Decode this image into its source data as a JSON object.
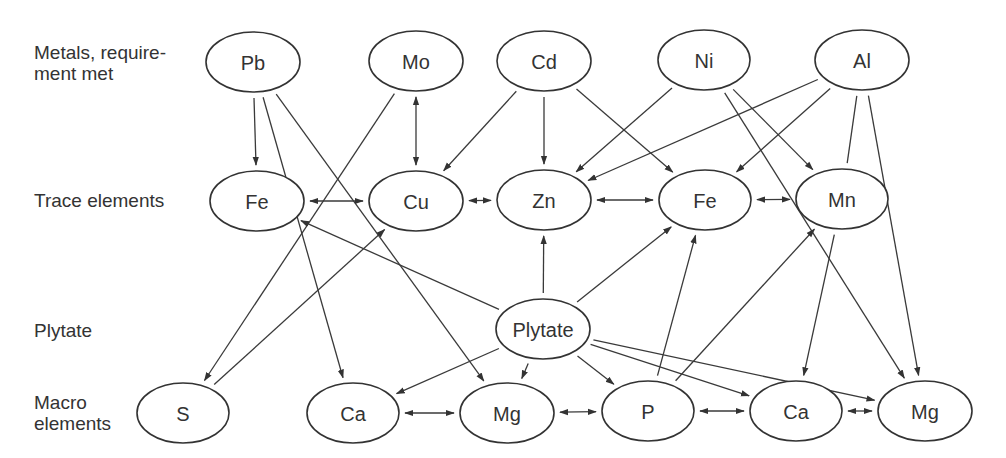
{
  "row_labels": [
    {
      "id": "metals",
      "text": "Metals, require-\nment met",
      "top": 42
    },
    {
      "id": "trace",
      "text": "Trace elements",
      "top": 190
    },
    {
      "id": "plytate",
      "text": "Plytate",
      "top": 320
    },
    {
      "id": "macro",
      "text": "Macro\nelements",
      "top": 392
    }
  ],
  "nodes": [
    {
      "id": "Pb",
      "label": "Pb",
      "cx": 253,
      "cy": 62,
      "rx": 47,
      "ry": 30
    },
    {
      "id": "Mo",
      "label": "Mo",
      "cx": 416,
      "cy": 61,
      "rx": 47,
      "ry": 30
    },
    {
      "id": "Cd",
      "label": "Cd",
      "cx": 544,
      "cy": 61,
      "rx": 47,
      "ry": 30
    },
    {
      "id": "Ni",
      "label": "Ni",
      "cx": 704,
      "cy": 60,
      "rx": 46,
      "ry": 30
    },
    {
      "id": "Al",
      "label": "Al",
      "cx": 862,
      "cy": 60,
      "rx": 47,
      "ry": 30
    },
    {
      "id": "Fe1",
      "label": "Fe",
      "cx": 257,
      "cy": 201,
      "rx": 47,
      "ry": 30
    },
    {
      "id": "Cu",
      "label": "Cu",
      "cx": 416,
      "cy": 201,
      "rx": 47,
      "ry": 30
    },
    {
      "id": "Zn",
      "label": "Zn",
      "cx": 544,
      "cy": 200,
      "rx": 47,
      "ry": 30
    },
    {
      "id": "Fe2",
      "label": "Fe",
      "cx": 705,
      "cy": 200,
      "rx": 46,
      "ry": 30
    },
    {
      "id": "Mn",
      "label": "Mn",
      "cx": 842,
      "cy": 199,
      "rx": 46,
      "ry": 30
    },
    {
      "id": "Plytate",
      "label": "Plytate",
      "cx": 543,
      "cy": 329,
      "rx": 47,
      "ry": 30
    },
    {
      "id": "S",
      "label": "S",
      "cx": 183,
      "cy": 413,
      "rx": 46,
      "ry": 30
    },
    {
      "id": "Ca1",
      "label": "Ca",
      "cx": 353,
      "cy": 413,
      "rx": 46,
      "ry": 30
    },
    {
      "id": "Mg1",
      "label": "Mg",
      "cx": 507,
      "cy": 413,
      "rx": 47,
      "ry": 30
    },
    {
      "id": "P",
      "label": "P",
      "cx": 648,
      "cy": 411,
      "rx": 46,
      "ry": 30
    },
    {
      "id": "Ca2",
      "label": "Ca",
      "cx": 796,
      "cy": 411,
      "rx": 46,
      "ry": 30
    },
    {
      "id": "Mg2",
      "label": "Mg",
      "cx": 925,
      "cy": 411,
      "rx": 47,
      "ry": 30
    }
  ],
  "edges": [
    {
      "from": "Pb",
      "to": "Fe1",
      "type": "directed"
    },
    {
      "from": "Pb",
      "to": "Ca1",
      "type": "directed"
    },
    {
      "from": "Pb",
      "to": "Mg1",
      "type": "directed"
    },
    {
      "from": "Mo",
      "to": "Cu",
      "type": "bidirectional"
    },
    {
      "from": "Mo",
      "to": "S",
      "type": "directed"
    },
    {
      "from": "S",
      "to": "Cu",
      "type": "directed"
    },
    {
      "from": "Cd",
      "to": "Cu",
      "type": "directed"
    },
    {
      "from": "Cd",
      "to": "Zn",
      "type": "directed"
    },
    {
      "from": "Cd",
      "to": "Fe2",
      "type": "directed"
    },
    {
      "from": "Ni",
      "to": "Zn",
      "type": "directed"
    },
    {
      "from": "Ni",
      "to": "Mn",
      "type": "directed"
    },
    {
      "from": "Ni",
      "to": "Mg2",
      "type": "directed"
    },
    {
      "from": "Al",
      "to": "Zn",
      "type": "directed"
    },
    {
      "from": "Al",
      "to": "Fe2",
      "type": "directed"
    },
    {
      "from": "Al",
      "to": "Mn",
      "type": "line"
    },
    {
      "from": "Al",
      "to": "Mg2",
      "type": "directed"
    },
    {
      "from": "Fe1",
      "to": "Cu",
      "type": "bidirectional"
    },
    {
      "from": "Cu",
      "to": "Zn",
      "type": "bidirectional"
    },
    {
      "from": "Zn",
      "to": "Fe2",
      "type": "bidirectional"
    },
    {
      "from": "Fe2",
      "to": "Mn",
      "type": "bidirectional"
    },
    {
      "from": "Plytate",
      "to": "Fe1",
      "type": "directed"
    },
    {
      "from": "Plytate",
      "to": "Zn",
      "type": "directed"
    },
    {
      "from": "Plytate",
      "to": "Fe2",
      "type": "directed"
    },
    {
      "from": "Plytate",
      "to": "Ca1",
      "type": "directed"
    },
    {
      "from": "Plytate",
      "to": "Mg1",
      "type": "directed"
    },
    {
      "from": "Plytate",
      "to": "P",
      "type": "directed"
    },
    {
      "from": "Plytate",
      "to": "Ca2",
      "type": "directed"
    },
    {
      "from": "Plytate",
      "to": "Mg2",
      "type": "directed"
    },
    {
      "from": "P",
      "to": "Fe2",
      "type": "directed"
    },
    {
      "from": "P",
      "to": "Mn",
      "type": "directed"
    },
    {
      "from": "Mn",
      "to": "Ca2",
      "type": "directed"
    },
    {
      "from": "Ca1",
      "to": "Mg1",
      "type": "bidirectional"
    },
    {
      "from": "Mg1",
      "to": "P",
      "type": "bidirectional"
    },
    {
      "from": "P",
      "to": "Ca2",
      "type": "bidirectional"
    },
    {
      "from": "Ca2",
      "to": "Mg2",
      "type": "bidirectional"
    }
  ],
  "style": {
    "stroke_color": "#333333",
    "background": "#ffffff"
  }
}
